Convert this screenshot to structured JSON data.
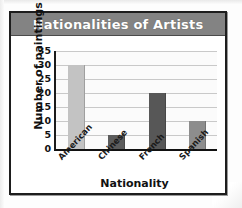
{
  "chart_data": {
    "type": "bar",
    "title": "Nationalities of Artists",
    "xlabel": "Nationality",
    "ylabel": "Number of paintings",
    "categories": [
      "American",
      "Chinese",
      "French",
      "Spanish"
    ],
    "values": [
      30,
      5,
      20,
      10
    ],
    "bar_colors": [
      "#c3c3c3",
      "#5c5c5c",
      "#575757",
      "#8d8d8d"
    ],
    "ylim": [
      0,
      35
    ],
    "ytick_labels": [
      "0",
      "5",
      "10",
      "15",
      "20",
      "25",
      "30",
      "35"
    ],
    "ytick_values": [
      0,
      5,
      10,
      15,
      20,
      25,
      30,
      35
    ],
    "grid": true,
    "legend": "none",
    "title_bar_color": "#838383",
    "title_text_color": "#ffffff",
    "plot_background": "#fbfbfb",
    "gridline_color": "#c9c9c9",
    "axis_color": "#111111",
    "frame_color": "#1d1d1d"
  }
}
